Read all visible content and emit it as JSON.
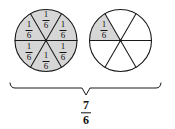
{
  "figure": {
    "caption_total": {
      "numerator": "7",
      "denominator": "6"
    },
    "shade_color": "#d6d6d6",
    "line_color": "#1a1a1a",
    "background_color": "#ffffff",
    "circles": [
      {
        "name": "circle-one",
        "cx": 46,
        "cy": 40.5,
        "r": 31,
        "parts": 6,
        "shaded_count": 6,
        "wedges": [
          {
            "index": 0,
            "shaded": true,
            "label": {
              "numerator": "1",
              "denominator": "6"
            },
            "label_x": 46,
            "label_y": 20
          },
          {
            "index": 1,
            "shaded": true,
            "label": {
              "numerator": "1",
              "denominator": "6"
            },
            "label_x": 63,
            "label_y": 30
          },
          {
            "index": 2,
            "shaded": true,
            "label": {
              "numerator": "1",
              "denominator": "6"
            },
            "label_x": 63,
            "label_y": 52
          },
          {
            "index": 3,
            "shaded": true,
            "label": {
              "numerator": "1",
              "denominator": "6"
            },
            "label_x": 46,
            "label_y": 61
          },
          {
            "index": 4,
            "shaded": true,
            "label": {
              "numerator": "1",
              "denominator": "6"
            },
            "label_x": 29,
            "label_y": 52
          },
          {
            "index": 5,
            "shaded": true,
            "label": {
              "numerator": "1",
              "denominator": "6"
            },
            "label_x": 29,
            "label_y": 30
          }
        ]
      },
      {
        "name": "circle-two",
        "cx": 120.5,
        "cy": 40.5,
        "r": 31,
        "parts": 6,
        "shaded_count": 1,
        "wedges": [
          {
            "index": 0,
            "shaded": false,
            "label": null,
            "label_x": 0,
            "label_y": 0
          },
          {
            "index": 1,
            "shaded": false,
            "label": null,
            "label_x": 0,
            "label_y": 0
          },
          {
            "index": 2,
            "shaded": false,
            "label": null,
            "label_x": 0,
            "label_y": 0
          },
          {
            "index": 3,
            "shaded": false,
            "label": null,
            "label_x": 0,
            "label_y": 0
          },
          {
            "index": 4,
            "shaded": false,
            "label": null,
            "label_x": 0,
            "label_y": 0
          },
          {
            "index": 5,
            "shaded": true,
            "label": {
              "numerator": "1",
              "denominator": "6"
            },
            "label_x": 104,
            "label_y": 30
          }
        ]
      }
    ],
    "brace": {
      "left_x": 10,
      "right_x": 161,
      "mid_x": 86,
      "top_y": 88,
      "tip_y": 95,
      "end_y": 83
    }
  },
  "chart_data": {
    "type": "pie",
    "title": "",
    "xlabel": "",
    "ylabel": "",
    "legend": [],
    "annotations": [
      "7/6"
    ],
    "charts": [
      {
        "name": "circle-one",
        "slices": 6,
        "slice_value": "1/6",
        "shaded_slices": 6,
        "slice_labels": [
          "1/6",
          "1/6",
          "1/6",
          "1/6",
          "1/6",
          "1/6"
        ]
      },
      {
        "name": "circle-two",
        "slices": 6,
        "slice_value": "1/6",
        "shaded_slices": 1,
        "slice_labels": [
          "1/6"
        ]
      }
    ],
    "total_shaded": "7/6"
  }
}
